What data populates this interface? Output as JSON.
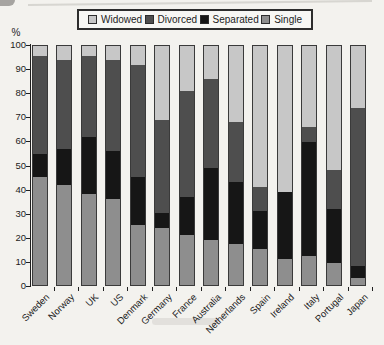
{
  "figure": {
    "kind": "scanned stacked bar chart",
    "background": "#f3f2ee"
  },
  "legend": {
    "position": "top",
    "order": [
      "Widowed",
      "Divorced",
      "Separated",
      "Single"
    ]
  },
  "chart_data": {
    "type": "bar",
    "stacked": true,
    "title": "",
    "xlabel": "",
    "ylabel": "%",
    "ylim": [
      0,
      100
    ],
    "y_ticks": [
      100,
      90,
      80,
      70,
      60,
      50,
      40,
      30,
      20,
      10,
      0
    ],
    "grid": false,
    "categories": [
      "Sweden",
      "Norway",
      "UK",
      "US",
      "Denmark",
      "Germany",
      "France",
      "Australia",
      "Netherlands",
      "Spain",
      "Ireland",
      "Italy",
      "Portugal",
      "Japan"
    ],
    "stack_order_bottom_to_top": [
      "Single",
      "Separated",
      "Divorced",
      "Widowed"
    ],
    "series": [
      {
        "name": "Single",
        "color": "#8e8e8e",
        "values": [
          45,
          42,
          38,
          36,
          25,
          24,
          21,
          19,
          17,
          15,
          11,
          12,
          9,
          3
        ]
      },
      {
        "name": "Separated",
        "color": "#161616",
        "values": [
          10,
          15,
          24,
          20,
          20,
          6,
          16,
          30,
          26,
          16,
          28,
          48,
          23,
          5
        ]
      },
      {
        "name": "Divorced",
        "color": "#4e4e4e",
        "values": [
          41,
          37,
          34,
          38,
          47,
          39,
          44,
          37,
          25,
          10,
          0,
          6,
          16,
          66
        ]
      },
      {
        "name": "Widowed",
        "color": "#c7c7c7",
        "values": [
          4,
          6,
          4,
          6,
          8,
          31,
          19,
          14,
          32,
          59,
          61,
          34,
          52,
          26
        ]
      }
    ],
    "axis_color": "#1f1f1f",
    "bar_outline_color": "#3a3a3a"
  }
}
